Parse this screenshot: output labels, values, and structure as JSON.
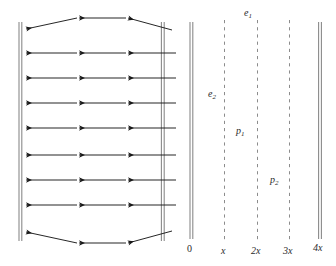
{
  "figure": {
    "panels": [
      {
        "id": "left-panel",
        "name": "flow-field-channel",
        "wall_left_x": 20,
        "wall_right_x": 163,
        "arrow_rows": 9,
        "arrow_columns": 3,
        "arrow_direction": "left",
        "top_row_curved": true,
        "bottom_row_curved": true,
        "stroke_color": "#1a1a1a",
        "wall_color": "#8a8a8a"
      },
      {
        "id": "right-panel",
        "name": "position-axis-diagram",
        "lines": [
          {
            "position_label": "0",
            "x": 191,
            "style": "solid-double"
          },
          {
            "position_label": "x",
            "x": 225,
            "style": "dashed"
          },
          {
            "position_label": "2x",
            "x": 258,
            "style": "dashed"
          },
          {
            "position_label": "3x",
            "x": 290,
            "style": "dashed"
          },
          {
            "position_label": "4x",
            "x": 320,
            "style": "solid-double"
          }
        ],
        "annotations": [
          {
            "id": "e1",
            "base": "e",
            "sub": "1",
            "x": 249,
            "y": 11
          },
          {
            "id": "e2",
            "base": "e",
            "sub": "2",
            "x": 212,
            "y": 92
          },
          {
            "id": "p1",
            "base": "p",
            "sub": "1",
            "x": 240,
            "y": 129
          },
          {
            "id": "p2",
            "base": "p",
            "sub": "2",
            "x": 274,
            "y": 178
          }
        ]
      }
    ],
    "axis_ticks": [
      {
        "label": "0",
        "x": 191,
        "y": 248,
        "italic": false
      },
      {
        "label": "x",
        "x": 224,
        "y": 250,
        "italic": true
      },
      {
        "label": "2x",
        "x": 255,
        "y": 250,
        "italic": true
      },
      {
        "label": "3x",
        "x": 287,
        "y": 250,
        "italic": true
      },
      {
        "label": "4x",
        "x": 317,
        "y": 247,
        "italic": true
      }
    ],
    "colors": {
      "ink": "#1a1a1a",
      "wall": "#8a8a8a",
      "dash": "#8c8c8c",
      "background": "#ffffff"
    }
  }
}
